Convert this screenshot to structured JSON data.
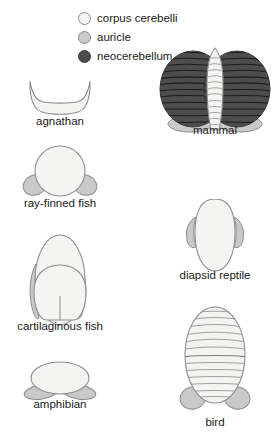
{
  "figure": {
    "colors": {
      "corpus_cerebelli": "#f4f4f2",
      "auricle": "#c9c9c9",
      "neocerebellum": "#4d4d4d",
      "outline": "#8d8d8d",
      "text": "#1a1a1a",
      "background": "#ffffff"
    }
  },
  "legend": {
    "items": [
      {
        "label": "corpus cerebelli",
        "swatch_name": "legend-swatch-corpus-cerebelli",
        "color": "#f4f4f2"
      },
      {
        "label": "auricle",
        "swatch_name": "legend-swatch-auricle",
        "color": "#c9c9c9"
      },
      {
        "label": "neocerebellum",
        "swatch_name": "legend-swatch-neocerebellum",
        "color": "#4d4d4d"
      }
    ]
  },
  "taxa": [
    {
      "key": "agnathan",
      "label": "agnathan",
      "parts": [
        "corpus cerebelli"
      ],
      "shape": "crescent",
      "column": "left"
    },
    {
      "key": "ray_finned_fish",
      "label": "ray-finned fish",
      "parts": [
        "corpus cerebelli",
        "auricle"
      ],
      "shape": "round corpus with two lateral auricles",
      "column": "left"
    },
    {
      "key": "cartilaginous_fish",
      "label": "cartilaginous fish",
      "parts": [
        "corpus cerebelli",
        "auricle"
      ],
      "shape": "tall bilobed corpus with slender lateral auricles",
      "column": "left"
    },
    {
      "key": "amphibian",
      "label": "amphibian",
      "parts": [
        "corpus cerebelli",
        "auricle"
      ],
      "shape": "wide flat corpus with two auricles beneath",
      "column": "left"
    },
    {
      "key": "mammal",
      "label": "mammal",
      "parts": [
        "corpus cerebelli",
        "auricle",
        "neocerebellum"
      ],
      "shape": "central foliated vermis flanked by two large dark neocerebellar hemispheres, auricles below",
      "folia_count": 22,
      "column": "right"
    },
    {
      "key": "diapsid_reptile",
      "label": "diapsid reptile",
      "parts": [
        "corpus cerebelli",
        "auricle"
      ],
      "shape": "tall tongue-shaped corpus with small upper lateral auricles",
      "column": "right"
    },
    {
      "key": "bird",
      "label": "bird",
      "parts": [
        "corpus cerebelli",
        "auricle"
      ],
      "shape": "large foliated oval corpus with two auricles beneath",
      "folia_count": 14,
      "column": "right"
    }
  ]
}
